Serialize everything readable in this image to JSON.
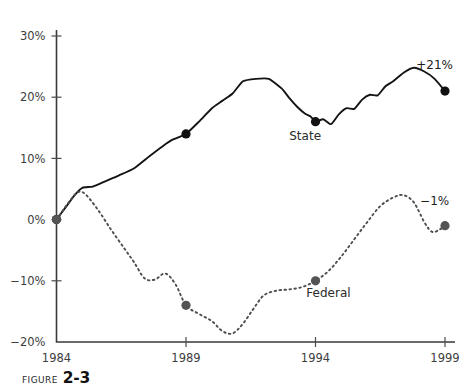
{
  "figure": {
    "caption_prefix": "FIGURE",
    "caption_number": "2-3"
  },
  "chart_data": {
    "type": "line",
    "title": "",
    "xlabel": "",
    "ylabel": "",
    "xlim": [
      1984,
      1999
    ],
    "ylim": [
      -20,
      30
    ],
    "grid": false,
    "legend_position": "inline-labels",
    "x_tick_labels": [
      "1984",
      "1989",
      "1994",
      "1999"
    ],
    "x_ticks": [
      1984,
      1989,
      1994,
      1999
    ],
    "y_tick_labels": [
      "30%",
      "20%",
      "10%",
      "0%",
      "-10%",
      "-20%"
    ],
    "y_ticks": [
      30,
      20,
      10,
      0,
      -10,
      -20
    ],
    "series": [
      {
        "name": "State",
        "style": "solid",
        "color": "#141414",
        "label": "State",
        "label_x": 1993.6,
        "label_y": 13.0,
        "endpoint_annotation": "+21%",
        "annotation_x": 1998.6,
        "annotation_y": 24.6,
        "markers": [
          {
            "x": 1984,
            "y": 0
          },
          {
            "x": 1989,
            "y": 14
          },
          {
            "x": 1994,
            "y": 16
          },
          {
            "x": 1999,
            "y": 21
          }
        ],
        "x": [
          1984,
          1984.35,
          1984.7,
          1985.0,
          1985.4,
          1985.9,
          1986.4,
          1987.0,
          1987.6,
          1988.1,
          1988.5,
          1989.0,
          1989.5,
          1990.0,
          1990.4,
          1990.8,
          1991.2,
          1991.7,
          1992.2,
          1992.7,
          1993.0,
          1993.3,
          1993.6,
          1993.8,
          1994.0,
          1994.3,
          1994.6,
          1994.9,
          1995.2,
          1995.5,
          1995.8,
          1996.1,
          1996.4,
          1996.7,
          1997.0,
          1997.4,
          1997.8,
          1998.2,
          1998.6,
          1999.0
        ],
        "values": [
          0,
          2.0,
          4.0,
          5.2,
          5.4,
          6.3,
          7.2,
          8.4,
          10.4,
          12.0,
          13.1,
          14.0,
          16.0,
          18.2,
          19.4,
          20.6,
          22.6,
          23.0,
          23.0,
          21.4,
          19.8,
          18.4,
          17.3,
          16.9,
          16.0,
          16.4,
          15.6,
          17.2,
          18.2,
          18.1,
          19.6,
          20.4,
          20.3,
          21.8,
          22.6,
          24.0,
          24.8,
          24.2,
          23.0,
          21.0
        ]
      },
      {
        "name": "Federal",
        "style": "dotted",
        "color": "#4d4d4d",
        "label": "Federal",
        "label_x": 1994.5,
        "label_y": -12.6,
        "endpoint_annotation": "-1%",
        "annotation_x": 1998.6,
        "annotation_y": 2.4,
        "markers": [
          {
            "x": 1984,
            "y": 0
          },
          {
            "x": 1989,
            "y": -14
          },
          {
            "x": 1994,
            "y": -10
          },
          {
            "x": 1999,
            "y": -1
          }
        ],
        "x": [
          1984,
          1984.4,
          1984.8,
          1985.1,
          1985.6,
          1986.1,
          1986.6,
          1987.0,
          1987.4,
          1987.8,
          1988.2,
          1988.6,
          1989.0,
          1989.5,
          1990.0,
          1990.4,
          1990.8,
          1991.2,
          1991.6,
          1992.0,
          1992.5,
          1993.0,
          1993.5,
          1994.0,
          1994.5,
          1995.0,
          1995.5,
          1996.0,
          1996.5,
          1997.0,
          1997.4,
          1997.8,
          1998.2,
          1998.5,
          1998.8,
          1999.0
        ],
        "values": [
          0,
          2.4,
          4.4,
          4.2,
          1.6,
          -1.6,
          -4.6,
          -7.0,
          -9.6,
          -9.8,
          -8.8,
          -10.6,
          -14.0,
          -15.4,
          -16.6,
          -18.2,
          -18.6,
          -17.0,
          -14.6,
          -12.4,
          -11.6,
          -11.4,
          -11.0,
          -10.0,
          -8.4,
          -6.0,
          -3.2,
          -0.4,
          2.2,
          3.6,
          4.0,
          2.8,
          -0.4,
          -2.0,
          -1.6,
          -1.0
        ]
      }
    ]
  }
}
